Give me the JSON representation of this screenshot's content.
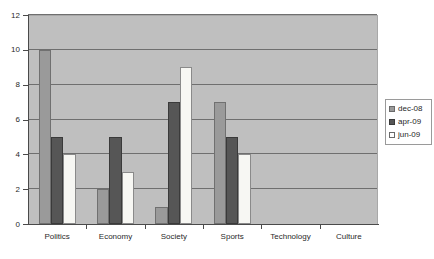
{
  "chart_data": {
    "type": "bar",
    "title": "",
    "subtitle": "",
    "xlabel": "",
    "ylabel": "",
    "categories": [
      "Politics",
      "Economy",
      "Society",
      "Sports",
      "Technology",
      "Culture"
    ],
    "series": [
      {
        "name": "dec-08",
        "values": [
          10,
          2,
          1,
          7,
          0,
          0
        ],
        "color": "#9a9a9a"
      },
      {
        "name": "apr-09",
        "values": [
          5,
          5,
          7,
          5,
          0,
          0
        ],
        "color": "#565656"
      },
      {
        "name": "jun-09",
        "values": [
          4,
          3,
          9,
          4,
          0,
          0
        ],
        "color": "#ffffff"
      }
    ],
    "ylim": [
      0,
      12
    ],
    "yticks": [
      0,
      2,
      4,
      6,
      8,
      10,
      12
    ],
    "ytick_labels": [
      "0",
      "2",
      "4",
      "6",
      "8",
      "10",
      "12"
    ],
    "grid": true,
    "grid_axis": "y",
    "legend_position": "right",
    "plot_background": "#bfbfbf",
    "gridline_color": "#6f6f6f",
    "axis_color": "#4a4a4a"
  }
}
